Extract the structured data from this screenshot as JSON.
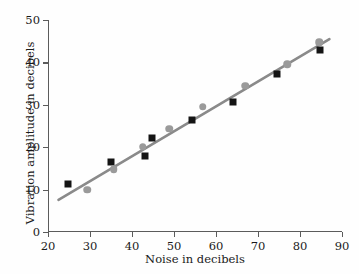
{
  "chart_data": {
    "type": "scatter",
    "title": "",
    "xlabel": "Noise in decibels",
    "ylabel": "Vibration amplitude in decibels",
    "xlim": [
      20,
      90
    ],
    "ylim": [
      0,
      50
    ],
    "xticks": [
      20,
      30,
      40,
      50,
      60,
      70,
      80,
      90
    ],
    "yticks": [
      0,
      10,
      20,
      30,
      40,
      50
    ],
    "grid": false,
    "legend": "none",
    "series": [
      {
        "name": "black-squares",
        "marker": "square",
        "color": "#141414",
        "points": [
          [
            24.7,
            11.4
          ],
          [
            35.0,
            16.6
          ],
          [
            44.8,
            22.2
          ],
          [
            54.4,
            26.5
          ],
          [
            64.1,
            30.7
          ],
          [
            74.5,
            37.2
          ],
          [
            84.7,
            43.0
          ],
          [
            43.0,
            17.9
          ]
        ]
      },
      {
        "name": "gray-circles",
        "marker": "circle",
        "color": "#9a9a9a",
        "points": [
          [
            29.4,
            10.0
          ],
          [
            35.6,
            14.8
          ],
          [
            42.5,
            20.1
          ],
          [
            48.9,
            24.4
          ],
          [
            56.9,
            29.5
          ],
          [
            67.0,
            34.5
          ],
          [
            77.0,
            39.6
          ],
          [
            84.6,
            44.7
          ]
        ]
      }
    ],
    "trendline": {
      "name": "fitted-regression-line",
      "color": "#8a8a8a",
      "x0": 22.5,
      "y0": 7.6,
      "x1": 87.0,
      "y1": 45.5
    }
  }
}
